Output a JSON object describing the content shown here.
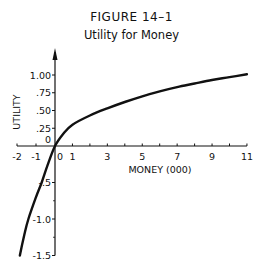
{
  "figure": {
    "number": "FIGURE 14–1",
    "title": "Utility for Money"
  },
  "chart_data": {
    "type": "line",
    "title": "Utility for Money",
    "figure_label": "FIGURE 14–1",
    "xlabel": "MONEY  (000)",
    "ylabel": "UTILITY",
    "xlim": [
      -2,
      11
    ],
    "ylim": [
      -1.5,
      1.15
    ],
    "grid": false,
    "legend": null,
    "x_ticks": [
      -2,
      -1,
      0,
      1,
      2,
      3,
      4,
      5,
      6,
      7,
      8,
      9,
      10,
      11
    ],
    "x_tick_labels": [
      {
        "value": -2,
        "label": "-2"
      },
      {
        "value": -1,
        "label": "-1"
      },
      {
        "value": 0,
        "label": "0"
      },
      {
        "value": 1,
        "label": "1"
      },
      {
        "value": 3,
        "label": "3"
      },
      {
        "value": 5,
        "label": "5"
      },
      {
        "value": 7,
        "label": "7"
      },
      {
        "value": 9,
        "label": "9"
      },
      {
        "value": 11,
        "label": "11"
      }
    ],
    "y_tick_labels": [
      {
        "value": 1.0,
        "label": "1.00"
      },
      {
        "value": 0.75,
        "label": ".75"
      },
      {
        "value": 0.5,
        "label": ".50"
      },
      {
        "value": 0.25,
        "label": ".25"
      },
      {
        "value": 0,
        "label": "0"
      },
      {
        "value": -0.5,
        "label": "-.5"
      },
      {
        "value": -1.0,
        "label": "-1.0"
      },
      {
        "value": -1.5,
        "label": "-1.5"
      }
    ],
    "series": [
      {
        "name": "Utility",
        "x": [
          -1.85,
          -1.6,
          -1.4,
          -1.0,
          -0.7,
          -0.4,
          0,
          0.5,
          1,
          2,
          3,
          4,
          5,
          6,
          7,
          8,
          9,
          10,
          11
        ],
        "y": [
          -1.5,
          -1.2,
          -1.0,
          -0.7,
          -0.5,
          -0.27,
          0,
          0.18,
          0.3,
          0.43,
          0.53,
          0.62,
          0.7,
          0.77,
          0.83,
          0.88,
          0.93,
          0.97,
          1.01
        ]
      }
    ]
  }
}
